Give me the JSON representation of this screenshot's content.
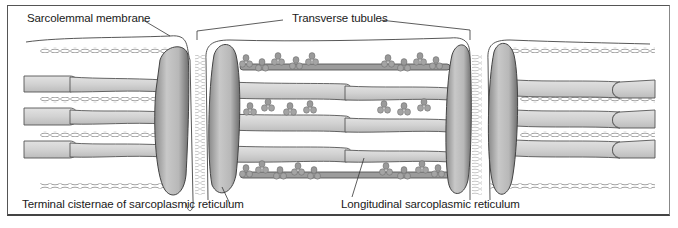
{
  "diagram": {
    "labels": {
      "sarcolemma": "Sarcolemmal membrane",
      "t_tubules": "Transverse tubules",
      "terminal_cisternae": "Terminal cisternae of sarcoplasmic reticulum",
      "longitudinal_sr": "Longitudinal sarcoplasmic reticulum"
    },
    "colors": {
      "tubule_fill": "#d4d4d4",
      "tubule_stroke": "#555555",
      "cisterna_fill": "#bdbdbd",
      "cisterna_shadow": "#7a7a7a",
      "myofilament": "#999999",
      "frame": "#555555"
    }
  }
}
